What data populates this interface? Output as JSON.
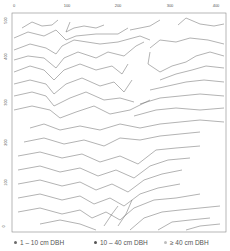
{
  "map": {
    "type": "topographic contour map",
    "x_axis": {
      "ticks": [
        "0",
        "100",
        "200",
        "300",
        "400"
      ],
      "range": [
        0,
        400
      ]
    },
    "y_axis": {
      "ticks": [
        "500",
        "400",
        "300",
        "200",
        "100",
        "0"
      ],
      "range": [
        0,
        500
      ]
    },
    "contour_color": "#555555",
    "frame_color": "#888888"
  },
  "legend": {
    "items": [
      {
        "label": "1 – 10 cm DBH",
        "color": "#6b6b6b"
      },
      {
        "label": "10 – 40 cm DBH",
        "color": "#555555"
      },
      {
        "label": "≥ 40 cm DBH",
        "color": "#bdbdbd"
      }
    ]
  }
}
